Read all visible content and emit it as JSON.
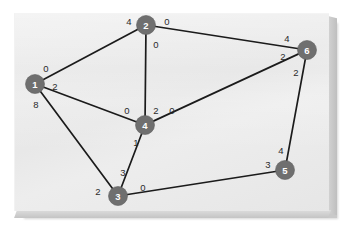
{
  "figure": {
    "kind": "directed-weighted-graph-diagram",
    "panel_color": "#ececec",
    "node_color": "#6f6f6f",
    "node_text_color": "#ffffff",
    "edge_color": "#1b1b1b",
    "weight_text_color": "#2a2a2a"
  },
  "nodes": [
    {
      "id": "1",
      "label": "1",
      "x": 35,
      "y": 84
    },
    {
      "id": "2",
      "label": "2",
      "x": 146,
      "y": 25
    },
    {
      "id": "3",
      "label": "3",
      "x": 118,
      "y": 196
    },
    {
      "id": "4",
      "label": "4",
      "x": 145,
      "y": 125
    },
    {
      "id": "5",
      "label": "5",
      "x": 285,
      "y": 170
    },
    {
      "id": "6",
      "label": "6",
      "x": 307,
      "y": 50
    }
  ],
  "edges": [
    {
      "from": "1",
      "to": "2",
      "from_weight": "0",
      "to_weight": "4",
      "from_weight_x": 46,
      "from_weight_y": 68,
      "to_weight_x": 129,
      "to_weight_y": 21
    },
    {
      "from": "2",
      "to": "6",
      "from_weight": "0",
      "to_weight": "4",
      "from_weight_x": 167,
      "from_weight_y": 21,
      "to_weight_x": 287,
      "to_weight_y": 38
    },
    {
      "from": "2",
      "to": "4",
      "from_weight": "0",
      "to_weight": "2",
      "from_weight_x": 156,
      "from_weight_y": 44,
      "to_weight_x": 156,
      "to_weight_y": 110
    },
    {
      "from": "1",
      "to": "4",
      "from_weight": "2",
      "to_weight": "0",
      "from_weight_x": 55,
      "from_weight_y": 86,
      "to_weight_x": 127,
      "to_weight_y": 110
    },
    {
      "from": "1",
      "to": "3",
      "from_weight": "8",
      "to_weight": "2",
      "from_weight_x": 36,
      "from_weight_y": 104,
      "to_weight_x": 98,
      "to_weight_y": 191
    },
    {
      "from": "3",
      "to": "4",
      "from_weight": "3",
      "to_weight": "1",
      "from_weight_x": 123,
      "from_weight_y": 172,
      "to_weight_x": 136,
      "to_weight_y": 142
    },
    {
      "from": "4",
      "to": "6",
      "from_weight": "0",
      "to_weight": "2",
      "from_weight_x": 172,
      "from_weight_y": 110,
      "to_weight_x": 283,
      "to_weight_y": 56
    },
    {
      "from": "6",
      "to": "5",
      "from_weight": "2",
      "to_weight": "4",
      "from_weight_x": 296,
      "from_weight_y": 72,
      "to_weight_x": 281,
      "to_weight_y": 150
    },
    {
      "from": "3",
      "to": "5",
      "from_weight": "0",
      "to_weight": "3",
      "from_weight_x": 143,
      "from_weight_y": 187,
      "to_weight_x": 268,
      "to_weight_y": 164
    }
  ],
  "weights_legend": {
    "edge_1_2": "0 / 4",
    "edge_2_6": "0 / 4",
    "edge_2_4": "0 / 2",
    "edge_1_4": "2 / 0",
    "edge_1_3": "8 / 2",
    "edge_3_4": "3 / 1",
    "edge_4_6": "0 / 2",
    "edge_6_5": "2 / 4",
    "edge_3_5": "0 / 3"
  }
}
